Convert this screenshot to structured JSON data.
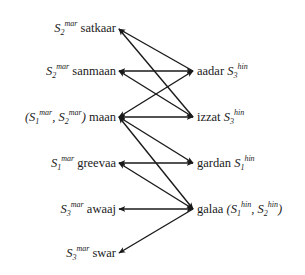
{
  "diagram": {
    "type": "bipartite-sense-mapping",
    "left_nodes": [
      {
        "id": "satkaar",
        "word": "satkaar",
        "senses": [
          {
            "s": "S",
            "sub": "2",
            "sup": "mar"
          }
        ],
        "paren": false
      },
      {
        "id": "sanmaan",
        "word": "sanmaan",
        "senses": [
          {
            "s": "S",
            "sub": "2",
            "sup": "mar"
          }
        ],
        "paren": false
      },
      {
        "id": "maan",
        "word": "maan",
        "senses": [
          {
            "s": "S",
            "sub": "1",
            "sup": "mar"
          },
          {
            "s": "S",
            "sub": "2",
            "sup": "mar"
          }
        ],
        "paren": true
      },
      {
        "id": "greevaa",
        "word": "greevaa",
        "senses": [
          {
            "s": "S",
            "sub": "1",
            "sup": "mar"
          }
        ],
        "paren": false
      },
      {
        "id": "awaaj",
        "word": "awaaj",
        "senses": [
          {
            "s": "S",
            "sub": "3",
            "sup": "mar"
          }
        ],
        "paren": false
      },
      {
        "id": "swar",
        "word": "swar",
        "senses": [
          {
            "s": "S",
            "sub": "3",
            "sup": "mar"
          }
        ],
        "paren": false
      }
    ],
    "right_nodes": [
      {
        "id": "aadar",
        "word": "aadar",
        "senses": [
          {
            "s": "S",
            "sub": "3",
            "sup": "hin"
          }
        ],
        "paren": false
      },
      {
        "id": "izzat",
        "word": "izzat",
        "senses": [
          {
            "s": "S",
            "sub": "3",
            "sup": "hin"
          }
        ],
        "paren": false
      },
      {
        "id": "gardan",
        "word": "gardan",
        "senses": [
          {
            "s": "S",
            "sub": "1",
            "sup": "hin"
          }
        ],
        "paren": false
      },
      {
        "id": "galaa",
        "word": "galaa",
        "senses": [
          {
            "s": "S",
            "sub": "1",
            "sup": "hin"
          },
          {
            "s": "S",
            "sub": "2",
            "sup": "hin"
          }
        ],
        "paren": true
      }
    ],
    "labels": {
      "satkaar": "satkaar",
      "sanmaan": "sanmaan",
      "maan": "maan",
      "greevaa": "greevaa",
      "awaaj": "awaaj",
      "swar": "swar",
      "aadar": "aadar",
      "izzat": "izzat",
      "gardan": "gardan",
      "galaa": "galaa",
      "S": "S",
      "mar": "mar",
      "hin": "hin",
      "sub1": "1",
      "sub2": "2",
      "sub3": "3",
      "lparen": "(",
      "rparen": ")",
      "comma": ", "
    },
    "edges": [
      {
        "from": "aadar",
        "to": "satkaar",
        "direction": "to-left"
      },
      {
        "from": "izzat",
        "to": "satkaar",
        "direction": "to-left"
      },
      {
        "from": "sanmaan",
        "to": "aadar",
        "direction": "both"
      },
      {
        "from": "sanmaan",
        "to": "izzat",
        "direction": "both"
      },
      {
        "from": "maan",
        "to": "aadar",
        "direction": "both"
      },
      {
        "from": "maan",
        "to": "izzat",
        "direction": "both"
      },
      {
        "from": "maan",
        "to": "gardan",
        "direction": "both"
      },
      {
        "from": "maan",
        "to": "galaa",
        "direction": "both"
      },
      {
        "from": "greevaa",
        "to": "gardan",
        "direction": "both"
      },
      {
        "from": "greevaa",
        "to": "galaa",
        "direction": "both"
      },
      {
        "from": "awaaj",
        "to": "galaa",
        "direction": "both"
      },
      {
        "from": "galaa",
        "to": "swar",
        "direction": "to-left"
      }
    ],
    "colors": {
      "line": "#1a1a1a",
      "text": "#1a1a1a",
      "background": "#ffffff"
    }
  }
}
